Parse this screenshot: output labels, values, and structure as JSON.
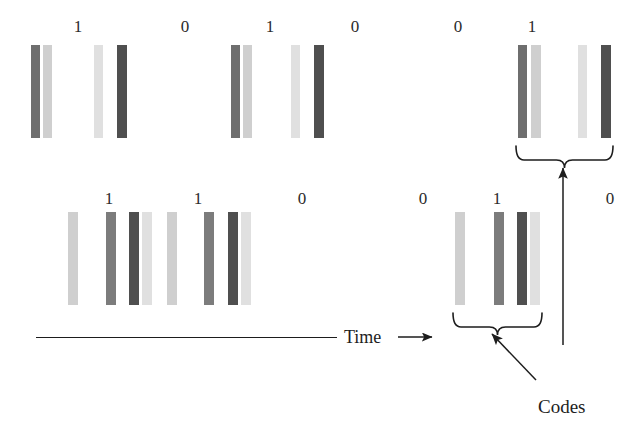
{
  "figure": {
    "type": "barcode-cdma-diagram",
    "width": 644,
    "height": 435,
    "background": "#ffffff",
    "palette": {
      "dark": "#585858",
      "darker": "#4a4a4a",
      "mid": "#8e8e8e",
      "light": "#bdbdbd",
      "lighter": "#d4d4d4",
      "lightest": "#e2e2e2",
      "ink": "#1d1d1d",
      "digit": "#2b2b2b"
    }
  },
  "rows": [
    {
      "name": "row-top",
      "digits": [
        {
          "label": "1",
          "x": 78,
          "y": 18
        },
        {
          "label": "0",
          "x": 185,
          "y": 18
        },
        {
          "label": "1",
          "x": 270,
          "y": 18
        },
        {
          "label": "0",
          "x": 355,
          "y": 18
        },
        {
          "label": "0",
          "x": 458,
          "y": 18
        },
        {
          "label": "1",
          "x": 532,
          "y": 18
        }
      ],
      "bars": [
        {
          "name": "bar-1",
          "x": 31,
          "y": 45,
          "w": 9,
          "h": 93,
          "color": "#6e6e6e"
        },
        {
          "name": "bar-2",
          "x": 43,
          "y": 45,
          "w": 9,
          "h": 93,
          "color": "#cfcfcf"
        },
        {
          "name": "bar-3",
          "x": 94,
          "y": 45,
          "w": 9,
          "h": 93,
          "color": "#e0e0e0"
        },
        {
          "name": "bar-4",
          "x": 117,
          "y": 45,
          "w": 10,
          "h": 93,
          "color": "#4f4f4f"
        },
        {
          "name": "bar-5",
          "x": 231,
          "y": 45,
          "w": 9,
          "h": 93,
          "color": "#6e6e6e"
        },
        {
          "name": "bar-6",
          "x": 243,
          "y": 45,
          "w": 9,
          "h": 93,
          "color": "#cfcfcf"
        },
        {
          "name": "bar-7",
          "x": 291,
          "y": 45,
          "w": 9,
          "h": 93,
          "color": "#e0e0e0"
        },
        {
          "name": "bar-8",
          "x": 314,
          "y": 45,
          "w": 10,
          "h": 93,
          "color": "#4f4f4f"
        },
        {
          "name": "bar-9",
          "x": 518,
          "y": 45,
          "w": 9,
          "h": 93,
          "color": "#6e6e6e"
        },
        {
          "name": "bar-10",
          "x": 531,
          "y": 45,
          "w": 10,
          "h": 93,
          "color": "#cfcfcf"
        },
        {
          "name": "bar-11",
          "x": 578,
          "y": 45,
          "w": 9,
          "h": 93,
          "color": "#e0e0e0"
        },
        {
          "name": "bar-12",
          "x": 601,
          "y": 45,
          "w": 10,
          "h": 93,
          "color": "#4f4f4f"
        }
      ]
    },
    {
      "name": "row-bottom",
      "digits": [
        {
          "label": "1",
          "x": 109,
          "y": 190
        },
        {
          "label": "1",
          "x": 198,
          "y": 190
        },
        {
          "label": "0",
          "x": 302,
          "y": 190
        },
        {
          "label": "0",
          "x": 423,
          "y": 190
        },
        {
          "label": "1",
          "x": 497,
          "y": 190
        },
        {
          "label": "0",
          "x": 610,
          "y": 190
        }
      ],
      "bars": [
        {
          "name": "bar-1",
          "x": 68,
          "y": 212,
          "w": 10,
          "h": 93,
          "color": "#cfcfcf"
        },
        {
          "name": "bar-2",
          "x": 106,
          "y": 212,
          "w": 10,
          "h": 93,
          "color": "#7c7c7c"
        },
        {
          "name": "bar-3",
          "x": 129,
          "y": 212,
          "w": 10,
          "h": 93,
          "color": "#4f4f4f"
        },
        {
          "name": "bar-4",
          "x": 142,
          "y": 212,
          "w": 10,
          "h": 93,
          "color": "#e0e0e0"
        },
        {
          "name": "bar-5",
          "x": 167,
          "y": 212,
          "w": 10,
          "h": 93,
          "color": "#cfcfcf"
        },
        {
          "name": "bar-6",
          "x": 204,
          "y": 212,
          "w": 10,
          "h": 93,
          "color": "#7c7c7c"
        },
        {
          "name": "bar-7",
          "x": 228,
          "y": 212,
          "w": 10,
          "h": 93,
          "color": "#4f4f4f"
        },
        {
          "name": "bar-8",
          "x": 241,
          "y": 212,
          "w": 10,
          "h": 93,
          "color": "#e0e0e0"
        },
        {
          "name": "bar-9",
          "x": 455,
          "y": 212,
          "w": 10,
          "h": 93,
          "color": "#cfcfcf"
        },
        {
          "name": "bar-10",
          "x": 494,
          "y": 212,
          "w": 10,
          "h": 93,
          "color": "#7c7c7c"
        },
        {
          "name": "bar-11",
          "x": 517,
          "y": 212,
          "w": 10,
          "h": 93,
          "color": "#4f4f4f"
        },
        {
          "name": "bar-12",
          "x": 530,
          "y": 212,
          "w": 10,
          "h": 93,
          "color": "#e0e0e0"
        }
      ]
    }
  ],
  "time_axis": {
    "label": "Time",
    "line": {
      "x1": 36,
      "y1": 337,
      "x2": 337,
      "y2": 337
    },
    "label_x": 344,
    "label_y": 327,
    "arrow": {
      "x1": 398,
      "y1": 337,
      "x2": 432,
      "y2": 337
    }
  },
  "annotations": {
    "codes_label": "Codes",
    "codes_label_x": 538,
    "codes_label_y": 396,
    "top_brace": {
      "left": 516,
      "right": 613,
      "y": 146,
      "depth": 14
    },
    "bottom_brace": {
      "left": 453,
      "right": 542,
      "y": 313,
      "depth": 14
    },
    "arrow_to_top_brace": {
      "x1": 563,
      "y1": 345,
      "x2": 563,
      "y2": 168
    },
    "arrow_to_bottom_brace": {
      "x1": 536,
      "y1": 380,
      "x2": 492,
      "y2": 334
    }
  }
}
